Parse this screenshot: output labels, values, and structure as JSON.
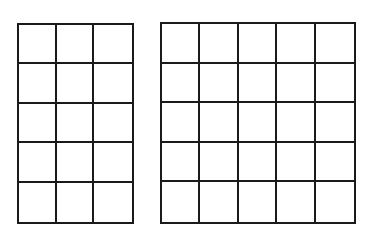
{
  "diagram": {
    "grids": [
      {
        "name": "grid-3x5",
        "cols": 3,
        "rows": 5,
        "x": 17,
        "y": 23,
        "width": 117,
        "height": 201
      },
      {
        "name": "grid-5x5",
        "cols": 5,
        "rows": 5,
        "x": 160,
        "y": 22,
        "width": 196,
        "height": 202
      }
    ],
    "line_color": "#1a1a1a",
    "background": "#ffffff"
  }
}
